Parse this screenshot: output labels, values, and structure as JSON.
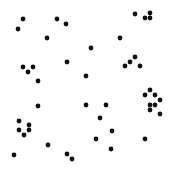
{
  "canvas": {
    "width": 178,
    "height": 179,
    "background": "#ffffff"
  },
  "dot": {
    "radius": 2.4,
    "color": "#111111"
  },
  "dots": [
    [
      23,
      19
    ],
    [
      18,
      29
    ],
    [
      57,
      19
    ],
    [
      66,
      24
    ],
    [
      47,
      38
    ],
    [
      67,
      62
    ],
    [
      23,
      67
    ],
    [
      33,
      67
    ],
    [
      28,
      72
    ],
    [
      38,
      81
    ],
    [
      86,
      76
    ],
    [
      135,
      14
    ],
    [
      150,
      13
    ],
    [
      145,
      18
    ],
    [
      150,
      18
    ],
    [
      120,
      38
    ],
    [
      91,
      48
    ],
    [
      135,
      57
    ],
    [
      130,
      62
    ],
    [
      125,
      66
    ],
    [
      140,
      66
    ],
    [
      150,
      90
    ],
    [
      145,
      95
    ],
    [
      155,
      95
    ],
    [
      160,
      100
    ],
    [
      150,
      105
    ],
    [
      155,
      105
    ],
    [
      150,
      110
    ],
    [
      160,
      114
    ],
    [
      106,
      105
    ],
    [
      100,
      118
    ],
    [
      112,
      131
    ],
    [
      96,
      139
    ],
    [
      145,
      139
    ],
    [
      111,
      149
    ],
    [
      38,
      106
    ],
    [
      86,
      105
    ],
    [
      19,
      121
    ],
    [
      29,
      125
    ],
    [
      19,
      130
    ],
    [
      29,
      130
    ],
    [
      24,
      135
    ],
    [
      48,
      145
    ],
    [
      14,
      155
    ],
    [
      67,
      154
    ],
    [
      72,
      159
    ]
  ]
}
